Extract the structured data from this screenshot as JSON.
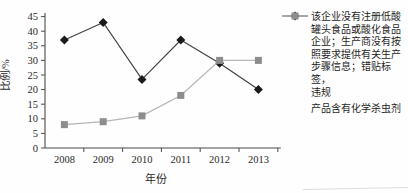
{
  "figure": {
    "ylabel": "比例/%",
    "xlabel": "年份"
  },
  "chart_data": {
    "type": "line",
    "title": "",
    "xlabel": "年份",
    "ylabel": "比例/%",
    "categories": [
      "2008",
      "2009",
      "2010",
      "2011",
      "2012",
      "2013"
    ],
    "ylim": [
      0,
      45
    ],
    "y_ticks": [
      0,
      5,
      10,
      15,
      20,
      25,
      30,
      35,
      40,
      45
    ],
    "grid": false,
    "legend_position": "right",
    "series": [
      {
        "name": "该企业没有注册低酸罐头食品或酸化食品企业；生产商没有按照要求提供有关生产步骤信息；错贴标签，违规",
        "marker": "diamond",
        "marker_color": "#1b1b1b",
        "line_color": "#454545",
        "values": [
          37,
          43,
          23.5,
          37,
          29,
          20
        ]
      },
      {
        "name": "产品含有化学杀虫剂",
        "marker": "square",
        "marker_color": "#8d8d8d",
        "line_color": "#b6b6b6",
        "values": [
          8,
          9,
          11,
          18,
          30,
          30
        ]
      }
    ]
  },
  "legend": {
    "items": [
      {
        "label": "该企业没有注册低酸\n罐头食品或酸化食品\n企业；生产商没有按\n照要求提供有关生产\n步骤信息；错贴标签，\n违规",
        "marker": "diamond-line"
      },
      {
        "label": "产品含有化学杀虫剂",
        "marker": "square-line"
      }
    ]
  },
  "colors": {
    "axis": "#4a4a4a",
    "text": "#2b2b2b",
    "series1_marker": "#1b1b1b",
    "series1_line": "#454545",
    "series2_marker": "#8d8d8d",
    "series2_line": "#b6b6b6"
  }
}
